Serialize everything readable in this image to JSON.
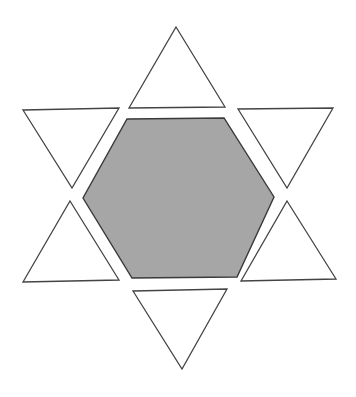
{
  "diagram": {
    "colors": {
      "background": "#ffffff",
      "hexagon_fill": "#a6a6a6",
      "hexagon_stroke": "#3a3a3a",
      "triangle_fill": "#ffffff",
      "triangle_stroke": "#444444"
    },
    "hexagon": {
      "points": "127,119 224,118 274,197 237,277 132,278 83,198"
    },
    "triangles": [
      {
        "name": "triangle-top",
        "orientation": "up",
        "points": "176,27 225,107 129,108"
      },
      {
        "name": "triangle-upper-left",
        "orientation": "down",
        "points": "23,110 119,108 72,188"
      },
      {
        "name": "triangle-upper-right",
        "orientation": "down",
        "points": "238,109 333,108 287,188"
      },
      {
        "name": "triangle-lower-left",
        "orientation": "up",
        "points": "70,201 119,280 23,282"
      },
      {
        "name": "triangle-lower-right",
        "orientation": "up",
        "points": "287,201 336,279 241,281"
      },
      {
        "name": "triangle-bottom",
        "orientation": "down",
        "points": "133,291 227,289 182,369"
      }
    ]
  }
}
